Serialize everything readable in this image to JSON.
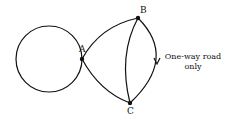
{
  "diagram": {
    "type": "graph",
    "nodes": [
      {
        "id": "A",
        "label": "A"
      },
      {
        "id": "B",
        "label": "B"
      },
      {
        "id": "C",
        "label": "C"
      }
    ],
    "edges": [
      {
        "from": "A",
        "to": "A",
        "kind": "loop"
      },
      {
        "from": "A",
        "to": "B"
      },
      {
        "from": "A",
        "to": "C"
      },
      {
        "from": "B",
        "to": "C",
        "kind": "inner-curve"
      },
      {
        "from": "B",
        "to": "C",
        "kind": "outer-curve",
        "directed": true
      }
    ],
    "annotation": {
      "line1": "One-way road",
      "line2": "only"
    },
    "colors": {
      "stroke": "#111111",
      "background": "#ffffff"
    }
  }
}
